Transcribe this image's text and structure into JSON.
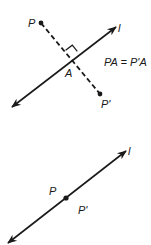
{
  "figure_top": {
    "line_label": "l",
    "point_label": "P",
    "image_label": "P'",
    "foot_label": "A",
    "equation": "PA = P'A",
    "geometry": {
      "line": {
        "x1": 12,
        "y1": 107,
        "x2": 116,
        "y2": 27
      },
      "point": {
        "x": 41,
        "y": 23
      },
      "image": {
        "x": 100,
        "y": 94
      },
      "foot": {
        "x": 72,
        "y": 58
      }
    }
  },
  "figure_bottom": {
    "line_label": "l",
    "point_label": "P",
    "image_label": "P'",
    "geometry": {
      "line": {
        "x1": 8,
        "y1": 243,
        "x2": 126,
        "y2": 151
      },
      "point": {
        "x": 66,
        "y": 198
      }
    }
  },
  "colors": {
    "stroke": "#1a1a1a",
    "background": "#ffffff"
  }
}
